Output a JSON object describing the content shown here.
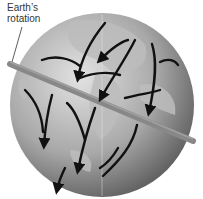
{
  "diagram": {
    "label_line1": "Earth’s",
    "label_line2": "rotation",
    "colors": {
      "globe_light": "#d8d8d8",
      "globe_dark": "#6e6e6e",
      "land": "#b5b5b5",
      "axis_rod": "#8a8a8a",
      "arrows": "#111111"
    }
  }
}
